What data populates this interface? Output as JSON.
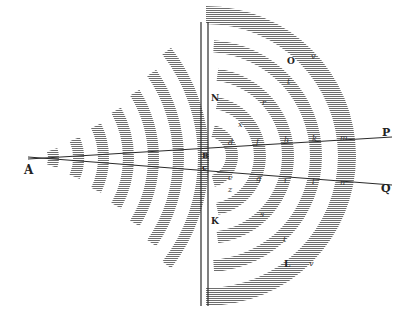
{
  "figure": {
    "ink_color": "#2a2a2a",
    "hatch_color": "#6e6e6e",
    "background": "#ffffff",
    "point_labels": {
      "A": "A",
      "B": "B",
      "C": "c",
      "N": "N",
      "K": "K",
      "P": "P",
      "Q": "Q",
      "O": "O",
      "L": "L"
    },
    "arc_letters_upper": [
      "d",
      "f",
      "h",
      "k",
      "m"
    ],
    "arc_letters_lower": [
      "e",
      "g",
      "i",
      "l",
      "n"
    ],
    "arc_letters_upper_outer": [
      "x",
      "r",
      "t",
      "v"
    ],
    "arc_letters_lower_outer": [
      "z",
      "s",
      "t",
      "v"
    ],
    "left_wave_count": 7,
    "right_wave_count": 5
  }
}
